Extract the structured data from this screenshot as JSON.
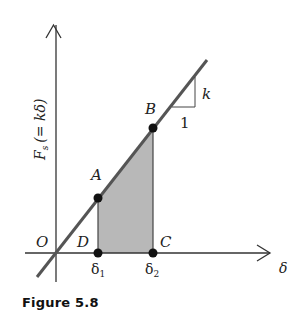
{
  "figure": {
    "caption": "Figure 5.8",
    "y_axis_label": "F_s (= kδ)",
    "y_axis_label_main": "F",
    "y_axis_label_sub": "s",
    "y_axis_label_rest": "(= kδ)",
    "x_axis_label": "δ",
    "origin_label": "O",
    "points": [
      {
        "label": "A",
        "description": "point on line at δ1"
      },
      {
        "label": "B",
        "description": "point on line at δ2"
      },
      {
        "label": "C",
        "description": "point on axis at δ2"
      },
      {
        "label": "D",
        "description": "point on axis at δ1"
      }
    ],
    "tick_labels": {
      "delta1_main": "δ",
      "delta1_sub": "1",
      "delta2_main": "δ",
      "delta2_sub": "2"
    },
    "slope_triangle": {
      "rise_label": "k",
      "run_label": "1"
    },
    "colors": {
      "line": "#555555",
      "axis": "#333333",
      "shade": "#b5b5b5",
      "points": "#111111"
    }
  }
}
